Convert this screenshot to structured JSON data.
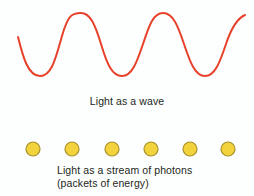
{
  "figure": {
    "name": "wave-particle-duality-of-light",
    "background_color": "#fdffff"
  },
  "wave": {
    "label": "Light as a wave",
    "stroke_color": "#e8412a",
    "stroke_width": 2,
    "cycles": 3,
    "start_x": 18,
    "end_x": 245,
    "peak_y": 13,
    "trough_y": 76,
    "baseline_y": 44.5,
    "amplitude": 31.5,
    "path": "M 18,37 C 23,57 28,76 40,76 C 52,76 56,57 62,36 C 68,15 72,13 81,13 C 90,13 95,24 101,44 C 107,64 112,76 122,76 C 132,76 137,62 143,44 C 149,26 153,13 163,13 C 173,13 178,26 184,44 C 190,62 195,76 205,76 C 215,76 220,62 226,44 C 232,26 238,18 245,15"
  },
  "photons": {
    "label_line_1": "Light as a stream of photons",
    "label_line_2": "(packets of energy)",
    "count": 6,
    "fill_color": "#f2d33c",
    "stroke_color": "#a8912b",
    "stroke_width": 1.2,
    "radius": 7,
    "center_y": 11,
    "centers_x": [
      33,
      72,
      112,
      151,
      190,
      228
    ]
  },
  "text_color": "#231f20"
}
